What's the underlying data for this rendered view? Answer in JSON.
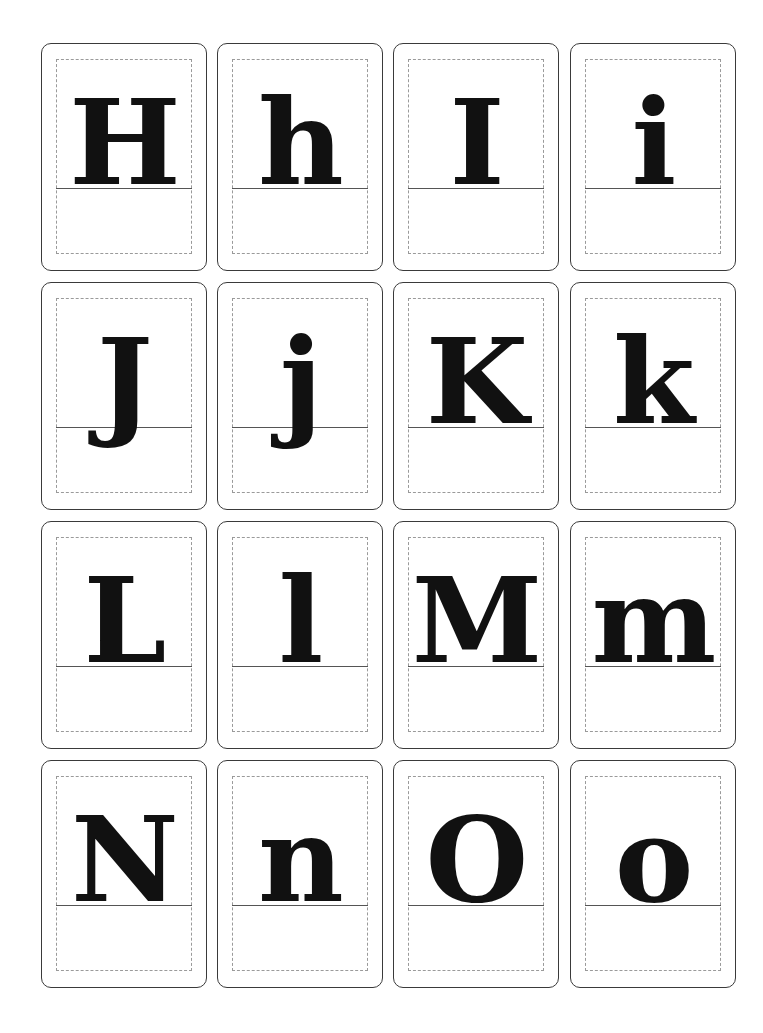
{
  "cards": [
    {
      "letter": "H"
    },
    {
      "letter": "h"
    },
    {
      "letter": "I"
    },
    {
      "letter": "i"
    },
    {
      "letter": "J"
    },
    {
      "letter": "j"
    },
    {
      "letter": "K"
    },
    {
      "letter": "k"
    },
    {
      "letter": "L"
    },
    {
      "letter": "l"
    },
    {
      "letter": "M"
    },
    {
      "letter": "m"
    },
    {
      "letter": "N"
    },
    {
      "letter": "n"
    },
    {
      "letter": "O"
    },
    {
      "letter": "o"
    }
  ]
}
